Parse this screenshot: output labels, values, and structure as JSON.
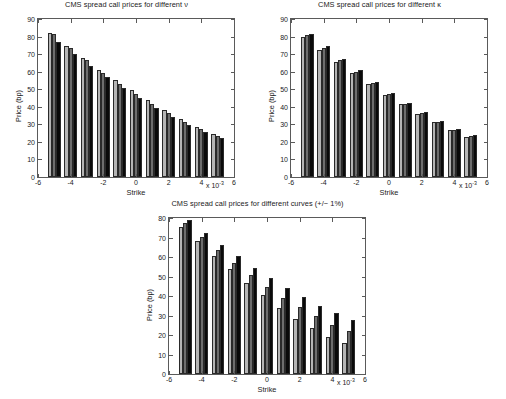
{
  "figure": {
    "background": "#ffffff",
    "axis_color": "#5a5a5a",
    "text_color": "#1a1a1a"
  },
  "series_colors": [
    "#b5b5b5",
    "#6e6e6e",
    "#0a0a0a"
  ],
  "axis_labels": {
    "y": "Price (bp)",
    "x": "Strike",
    "x_multiplier_prefix": "x 10",
    "x_multiplier_exponent": "-3"
  },
  "chart_data": [
    {
      "id": "chart-vol",
      "type": "bar",
      "title": "CMS spread call prices for different ν",
      "xlabel": "Strike",
      "ylabel": "Price (bp)",
      "xlim": [
        -6,
        6
      ],
      "ylim": [
        0,
        90
      ],
      "xticks": [
        -6,
        -4,
        -2,
        0,
        2,
        4,
        6
      ],
      "yticks": [
        0,
        10,
        20,
        30,
        40,
        50,
        60,
        70,
        80,
        90
      ],
      "x_multiplier": "x 10^-3",
      "grid": false,
      "legend": "none",
      "categories": [
        -5,
        -4,
        -3,
        -2,
        -1,
        0,
        1,
        2,
        3,
        4,
        5
      ],
      "series": [
        {
          "name": "nu low",
          "values": [
            82.0,
            74.5,
            67.8,
            61.0,
            55.0,
            49.3,
            43.7,
            38.0,
            33.0,
            28.6,
            24.6
          ]
        },
        {
          "name": "nu mid",
          "values": [
            81.3,
            73.7,
            66.5,
            59.5,
            53.0,
            47.3,
            41.5,
            36.2,
            31.4,
            27.3,
            23.5
          ]
        },
        {
          "name": "nu high",
          "values": [
            76.8,
            70.2,
            63.4,
            56.9,
            50.8,
            44.9,
            39.3,
            34.2,
            29.6,
            25.8,
            22.1
          ]
        }
      ]
    },
    {
      "id": "chart-kappa",
      "type": "bar",
      "title": "CMS spread call prices for different κ",
      "xlabel": "Strike",
      "ylabel": "Price (bp)",
      "xlim": [
        -6,
        6
      ],
      "ylim": [
        0,
        90
      ],
      "xticks": [
        -6,
        -4,
        -2,
        0,
        2,
        4,
        6
      ],
      "yticks": [
        0,
        10,
        20,
        30,
        40,
        50,
        60,
        70,
        80,
        90
      ],
      "x_multiplier": "x 10^-3",
      "grid": false,
      "legend": "none",
      "categories": [
        -5,
        -4,
        -3,
        -2,
        -1,
        0,
        1,
        2,
        3,
        4,
        5
      ],
      "series": [
        {
          "name": "kappa low",
          "values": [
            80.0,
            72.5,
            65.5,
            59.3,
            53.0,
            47.0,
            41.4,
            36.0,
            31.1,
            26.6,
            22.9
          ]
        },
        {
          "name": "kappa mid",
          "values": [
            80.8,
            73.5,
            66.5,
            60.0,
            53.6,
            47.5,
            41.8,
            36.4,
            31.4,
            26.9,
            23.3
          ]
        },
        {
          "name": "kappa high",
          "values": [
            81.5,
            74.4,
            67.5,
            60.7,
            54.2,
            48.0,
            42.3,
            36.8,
            31.8,
            27.3,
            23.7
          ]
        }
      ]
    },
    {
      "id": "chart-curves",
      "type": "bar",
      "title": "CMS spread call prices for different curves (+/− 1%)",
      "xlabel": "Strike",
      "ylabel": "Price (bp)",
      "xlim": [
        -6,
        6
      ],
      "ylim": [
        0,
        80
      ],
      "xticks": [
        -6,
        -4,
        -2,
        0,
        2,
        4,
        6
      ],
      "yticks": [
        0,
        10,
        20,
        30,
        40,
        50,
        60,
        70,
        80
      ],
      "x_multiplier": "x 10^-3",
      "grid": false,
      "legend": "none",
      "categories": [
        -5,
        -4,
        -3,
        -2,
        -1,
        0,
        1,
        2,
        3,
        4,
        5
      ],
      "series": [
        {
          "name": "curve -1%",
          "values": [
            75.6,
            68.2,
            60.5,
            53.6,
            46.7,
            40.3,
            34.0,
            28.3,
            23.4,
            19.2,
            15.7
          ]
        },
        {
          "name": "curve base",
          "values": [
            77.4,
            70.5,
            63.4,
            57.0,
            50.7,
            44.7,
            39.1,
            34.2,
            29.8,
            25.3,
            22.0
          ]
        },
        {
          "name": "curve +1%",
          "values": [
            78.9,
            72.5,
            66.3,
            60.5,
            54.6,
            49.1,
            44.2,
            39.5,
            35.1,
            31.2,
            27.8
          ]
        }
      ]
    }
  ]
}
